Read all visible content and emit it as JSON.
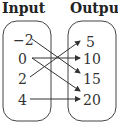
{
  "titles": {
    "input": "Input",
    "output": "Output"
  },
  "inputs": [
    "−2",
    "0",
    "2",
    "4"
  ],
  "outputs": [
    "5",
    "10",
    "15",
    "20"
  ],
  "mappings": [
    {
      "from": "−2",
      "to": "15"
    },
    {
      "from": "0",
      "to": "10"
    },
    {
      "from": "0",
      "to": "20"
    },
    {
      "from": "2",
      "to": "5"
    },
    {
      "from": "4",
      "to": "20"
    }
  ]
}
